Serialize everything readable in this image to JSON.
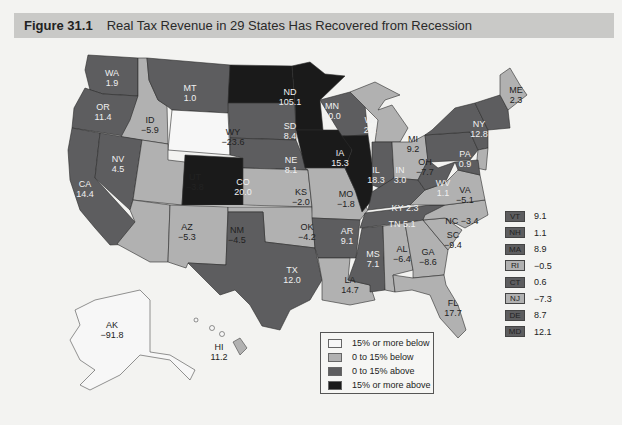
{
  "figure": {
    "number": "Figure 31.1",
    "title": "Real Tax Revenue in 29 States Has Recovered from Recession"
  },
  "colors": {
    "header_bg": "#c9c9c7",
    "category_15_below": "#f7f7f7",
    "category_0_15_below": "#b1b1b1",
    "category_0_15_above": "#5d5d5f",
    "category_15_above": "#1a1a1a"
  },
  "legend": {
    "items": [
      {
        "label": "15% or more below",
        "color": "#f7f7f7"
      },
      {
        "label": "0 to 15% below",
        "color": "#b1b1b1"
      },
      {
        "label": "0 to 15% above",
        "color": "#5d5d5f"
      },
      {
        "label": "15% or more above",
        "color": "#1a1a1a"
      }
    ]
  },
  "states": {
    "WA": {
      "abbr": "WA",
      "value": "1.9"
    },
    "OR": {
      "abbr": "OR",
      "value": "11.4"
    },
    "CA": {
      "abbr": "CA",
      "value": "14.4"
    },
    "ID": {
      "abbr": "ID",
      "value": "−5.9"
    },
    "NV": {
      "abbr": "NV",
      "value": "4.5"
    },
    "MT": {
      "abbr": "MT",
      "value": "1.0"
    },
    "WY": {
      "abbr": "WY",
      "value": "−23.6"
    },
    "UT": {
      "abbr": "UT",
      "value": "−3.8"
    },
    "AZ": {
      "abbr": "AZ",
      "value": "−5.3"
    },
    "CO": {
      "abbr": "CO",
      "value": "20.0"
    },
    "NM": {
      "abbr": "NM",
      "value": "−4.5"
    },
    "ND": {
      "abbr": "ND",
      "value": "105.1"
    },
    "SD": {
      "abbr": "SD",
      "value": "8.4"
    },
    "NE": {
      "abbr": "NE",
      "value": "8.1"
    },
    "KS": {
      "abbr": "KS",
      "value": "−2.0"
    },
    "OK": {
      "abbr": "OK",
      "value": "−4.2"
    },
    "TX": {
      "abbr": "TX",
      "value": "12.0"
    },
    "MN": {
      "abbr": "MN",
      "value": "20.0"
    },
    "IA": {
      "abbr": "IA",
      "value": "15.3"
    },
    "MO": {
      "abbr": "MO",
      "value": "−1.8"
    },
    "AR": {
      "abbr": "AR",
      "value": "9.1"
    },
    "LA": {
      "abbr": "LA",
      "value": "14.7"
    },
    "WI": {
      "abbr": "WI",
      "value": "2.2"
    },
    "IL": {
      "abbr": "IL",
      "value": "18.3"
    },
    "MI": {
      "abbr": "MI",
      "value": "9.2"
    },
    "IN": {
      "abbr": "IN",
      "value": "3.0"
    },
    "OH": {
      "abbr": "OH",
      "value": "−7.7"
    },
    "KY": {
      "abbr": "KY",
      "value": "2.3"
    },
    "TN": {
      "abbr": "TN",
      "value": "5.1"
    },
    "MS": {
      "abbr": "MS",
      "value": "7.1"
    },
    "AL": {
      "abbr": "AL",
      "value": "−6.4"
    },
    "GA": {
      "abbr": "GA",
      "value": "−8.6"
    },
    "FL": {
      "abbr": "FL",
      "value": "17.7"
    },
    "SC": {
      "abbr": "SC",
      "value": "−9.4"
    },
    "NC": {
      "abbr": "NC",
      "value": "−3.4"
    },
    "VA": {
      "abbr": "VA",
      "value": "−5.1"
    },
    "WV": {
      "abbr": "WV",
      "value": "1.1"
    },
    "PA": {
      "abbr": "PA",
      "value": "0.9"
    },
    "NY": {
      "abbr": "NY",
      "value": "12.8"
    },
    "ME": {
      "abbr": "ME",
      "value": "2.3"
    },
    "AK": {
      "abbr": "AK",
      "value": "−91.8"
    },
    "HI": {
      "abbr": "HI",
      "value": "11.2"
    }
  },
  "inset_states": [
    {
      "abbr": "VT",
      "value": "9.1",
      "color": "#5d5d5f"
    },
    {
      "abbr": "NH",
      "value": "1.1",
      "color": "#5d5d5f"
    },
    {
      "abbr": "MA",
      "value": "8.9",
      "color": "#5d5d5f"
    },
    {
      "abbr": "RI",
      "value": "−0.5",
      "color": "#b1b1b1"
    },
    {
      "abbr": "CT",
      "value": "0.6",
      "color": "#5d5d5f"
    },
    {
      "abbr": "NJ",
      "value": "−7.3",
      "color": "#b1b1b1"
    },
    {
      "abbr": "DE",
      "value": "8.7",
      "color": "#5d5d5f"
    },
    {
      "abbr": "MD",
      "value": "12.1",
      "color": "#5d5d5f"
    }
  ],
  "percent_sign": "%"
}
